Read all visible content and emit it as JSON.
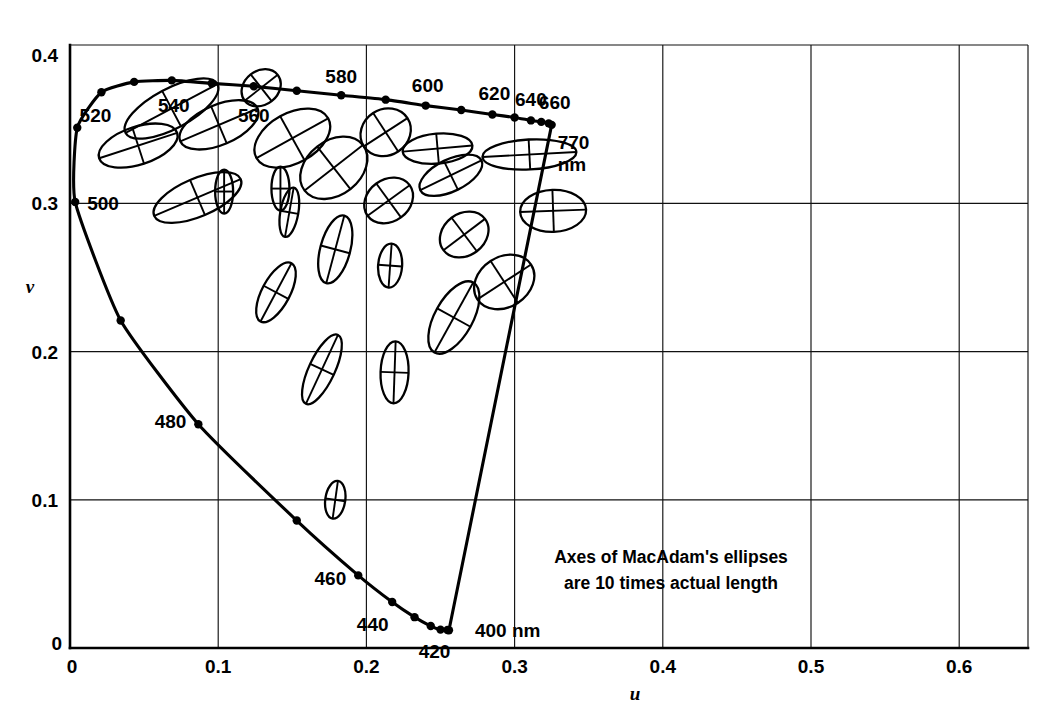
{
  "figure": {
    "annotation_line1": "Axes of MacAdam's ellipses",
    "annotation_line2": "are 10 times actual length",
    "axis_color": "#000000",
    "background_color": "#ffffff"
  },
  "axes": {
    "xlabel": "u",
    "ylabel": "v",
    "x_origin_label": "0",
    "y_origin_label": "0",
    "x_ticks": [
      "0.1",
      "0.2",
      "0.3",
      "0.4",
      "0.5",
      "0.6"
    ],
    "y_ticks": [
      "0.1",
      "0.2",
      "0.3",
      "0.4"
    ]
  },
  "chart_data": {
    "type": "scatter",
    "xlabel": "u",
    "ylabel": "v",
    "xlim": [
      0.0,
      0.65
    ],
    "ylim": [
      0.0,
      0.41
    ],
    "grid": true,
    "legend": null,
    "annotations": [
      {
        "text": "Axes of MacAdam's ellipses are 10 times actual length",
        "u": 0.4,
        "v": 0.055
      },
      {
        "text": "770 nm",
        "u": 0.625,
        "v": 0.315
      }
    ],
    "spectral_locus": {
      "name": "Spectral locus (monochromatic wavelengths)",
      "unit": "nm",
      "points": [
        {
          "wl": 400,
          "u": 0.2557,
          "v": 0.012,
          "dot": true,
          "label": "400 nm"
        },
        {
          "wl": 410,
          "u": 0.2547,
          "v": 0.0121,
          "dot": true,
          "label": ""
        },
        {
          "wl": 420,
          "u": 0.25,
          "v": 0.0124,
          "dot": true,
          "label": "420"
        },
        {
          "wl": 430,
          "u": 0.2434,
          "v": 0.0148,
          "dot": true,
          "label": ""
        },
        {
          "wl": 440,
          "u": 0.2325,
          "v": 0.0208,
          "dot": true,
          "label": "440"
        },
        {
          "wl": 450,
          "u": 0.2174,
          "v": 0.031,
          "dot": true,
          "label": ""
        },
        {
          "wl": 460,
          "u": 0.1945,
          "v": 0.049,
          "dot": true,
          "label": "460"
        },
        {
          "wl": 470,
          "u": 0.153,
          "v": 0.086,
          "dot": true,
          "label": ""
        },
        {
          "wl": 480,
          "u": 0.0866,
          "v": 0.151,
          "dot": true,
          "label": "480"
        },
        {
          "wl": 490,
          "u": 0.0342,
          "v": 0.221,
          "dot": true,
          "label": ""
        },
        {
          "wl": 500,
          "u": 0.0035,
          "v": 0.301,
          "dot": true,
          "label": "500"
        },
        {
          "wl": 510,
          "u": 0.0049,
          "v": 0.351,
          "dot": true,
          "label": ""
        },
        {
          "wl": 520,
          "u": 0.0212,
          "v": 0.375,
          "dot": true,
          "label": "520"
        },
        {
          "wl": 530,
          "u": 0.0433,
          "v": 0.382,
          "dot": true,
          "label": ""
        },
        {
          "wl": 540,
          "u": 0.0687,
          "v": 0.383,
          "dot": true,
          "label": "540"
        },
        {
          "wl": 550,
          "u": 0.0956,
          "v": 0.381,
          "dot": true,
          "label": ""
        },
        {
          "wl": 560,
          "u": 0.124,
          "v": 0.379,
          "dot": true,
          "label": "560"
        },
        {
          "wl": 570,
          "u": 0.153,
          "v": 0.376,
          "dot": true,
          "label": ""
        },
        {
          "wl": 580,
          "u": 0.183,
          "v": 0.373,
          "dot": true,
          "label": "580"
        },
        {
          "wl": 590,
          "u": 0.213,
          "v": 0.37,
          "dot": true,
          "label": ""
        },
        {
          "wl": 600,
          "u": 0.24,
          "v": 0.366,
          "dot": true,
          "label": "600"
        },
        {
          "wl": 610,
          "u": 0.264,
          "v": 0.363,
          "dot": true,
          "label": ""
        },
        {
          "wl": 620,
          "u": 0.285,
          "v": 0.36,
          "dot": true,
          "label": "620"
        },
        {
          "wl": 630,
          "u": 0.3,
          "v": 0.358,
          "dot": true,
          "label": ""
        },
        {
          "wl": 640,
          "u": 0.311,
          "v": 0.356,
          "dot": true,
          "label": "640"
        },
        {
          "wl": 650,
          "u": 0.318,
          "v": 0.355,
          "dot": true,
          "label": ""
        },
        {
          "wl": 660,
          "u": 0.323,
          "v": 0.354,
          "dot": true,
          "label": "660"
        },
        {
          "wl": 770,
          "u": 0.325,
          "v": 0.353,
          "dot": true,
          "label": "770 nm"
        }
      ]
    },
    "purple_line": {
      "name": "Line of purples",
      "from_wl": 770,
      "to_wl": 400
    },
    "ellipses": {
      "name": "MacAdam just-noticeable-difference ellipses (axes 10x actual)",
      "count": 25,
      "scale_factor": 10,
      "items": [
        {
          "id": 1,
          "u": 0.0685,
          "v": 0.364,
          "a_px": 52,
          "b_px": 20,
          "angle_deg": -28
        },
        {
          "id": 2,
          "u": 0.046,
          "v": 0.339,
          "a_px": 41,
          "b_px": 19,
          "angle_deg": -18
        },
        {
          "id": 3,
          "u": 0.1005,
          "v": 0.353,
          "a_px": 42,
          "b_px": 20,
          "angle_deg": -23
        },
        {
          "id": 4,
          "u": 0.086,
          "v": 0.304,
          "a_px": 47,
          "b_px": 19,
          "angle_deg": -23
        },
        {
          "id": 5,
          "u": 0.15,
          "v": 0.344,
          "a_px": 41,
          "b_px": 25,
          "angle_deg": -29
        },
        {
          "id": 6,
          "u": 0.178,
          "v": 0.324,
          "a_px": 37,
          "b_px": 27,
          "angle_deg": -38
        },
        {
          "id": 7,
          "u": 0.179,
          "v": 0.269,
          "a_px": 35,
          "b_px": 15,
          "angle_deg": -75
        },
        {
          "id": 8,
          "u": 0.139,
          "v": 0.24,
          "a_px": 33,
          "b_px": 14,
          "angle_deg": -62
        },
        {
          "id": 9,
          "u": 0.17,
          "v": 0.188,
          "a_px": 38,
          "b_px": 13,
          "angle_deg": -65
        },
        {
          "id": 10,
          "u": 0.179,
          "v": 0.1,
          "a_px": 19,
          "b_px": 10,
          "angle_deg": -82
        },
        {
          "id": 11,
          "u": 0.215,
          "v": 0.302,
          "a_px": 26,
          "b_px": 21,
          "angle_deg": -36
        },
        {
          "id": 12,
          "u": 0.213,
          "v": 0.348,
          "a_px": 26,
          "b_px": 23,
          "angle_deg": -33
        },
        {
          "id": 13,
          "u": 0.216,
          "v": 0.258,
          "a_px": 22,
          "b_px": 12,
          "angle_deg": -86
        },
        {
          "id": 14,
          "u": 0.219,
          "v": 0.186,
          "a_px": 31,
          "b_px": 14,
          "angle_deg": -88
        },
        {
          "id": 15,
          "u": 0.248,
          "v": 0.337,
          "a_px": 35,
          "b_px": 15,
          "angle_deg": -5
        },
        {
          "id": 16,
          "u": 0.257,
          "v": 0.319,
          "a_px": 34,
          "b_px": 16,
          "angle_deg": -26
        },
        {
          "id": 17,
          "u": 0.266,
          "v": 0.279,
          "a_px": 26,
          "b_px": 21,
          "angle_deg": -37
        },
        {
          "id": 18,
          "u": 0.259,
          "v": 0.223,
          "a_px": 40,
          "b_px": 19,
          "angle_deg": -61
        },
        {
          "id": 19,
          "u": 0.31,
          "v": 0.333,
          "a_px": 47,
          "b_px": 15,
          "angle_deg": -3
        },
        {
          "id": 20,
          "u": 0.326,
          "v": 0.295,
          "a_px": 33,
          "b_px": 21,
          "angle_deg": -2
        },
        {
          "id": 21,
          "u": 0.293,
          "v": 0.247,
          "a_px": 32,
          "b_px": 25,
          "angle_deg": -33
        },
        {
          "id": 22,
          "u": 0.129,
          "v": 0.378,
          "a_px": 21,
          "b_px": 17,
          "angle_deg": -38
        },
        {
          "id": 23,
          "u": 0.148,
          "v": 0.294,
          "a_px": 25,
          "b_px": 9,
          "angle_deg": -80
        },
        {
          "id": 24,
          "u": 0.142,
          "v": 0.31,
          "a_px": 9,
          "b_px": 22,
          "angle_deg": 0
        },
        {
          "id": 25,
          "u": 0.104,
          "v": 0.308,
          "a_px": 9,
          "b_px": 22,
          "angle_deg": 0
        }
      ]
    }
  }
}
